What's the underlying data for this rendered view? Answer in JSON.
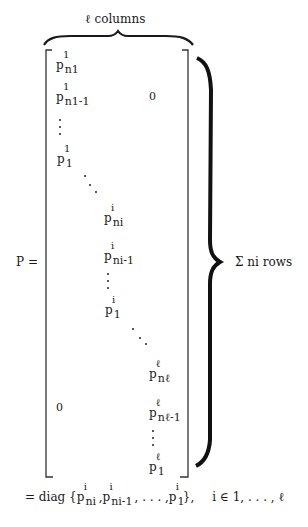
{
  "figure": {
    "top_label": "ℓ columns",
    "right_label": "Σ ni rows",
    "lhs": "P =",
    "zero_upper": "0",
    "zero_lower": "0",
    "block1": [
      {
        "base": "p",
        "sup": "1",
        "sub": "n1"
      },
      {
        "base": "p",
        "sup": "1",
        "sub": "n1-1"
      },
      {
        "base": "p",
        "sup": "1",
        "sub": "1"
      }
    ],
    "blocki": [
      {
        "base": "p",
        "sup": "i",
        "sub": "ni"
      },
      {
        "base": "p",
        "sup": "i",
        "sub": "ni-1"
      },
      {
        "base": "p",
        "sup": "i",
        "sub": "1"
      }
    ],
    "blockl": [
      {
        "base": "p",
        "sup": "ℓ",
        "sub": "nℓ"
      },
      {
        "base": "p",
        "sup": "ℓ",
        "sub": "nℓ-1"
      },
      {
        "base": "p",
        "sup": "ℓ",
        "sub": "1"
      }
    ],
    "equation": {
      "prefix": "= diag {",
      "terms": [
        {
          "base": "p",
          "sup": "i",
          "sub": "ni"
        },
        {
          "base": "p",
          "sup": "i",
          "sub": "ni-1"
        },
        {
          "base": "p",
          "sup": "i",
          "sub": "1"
        }
      ],
      "sep1": ",",
      "sep2": ", . . . ,",
      "suffix": "},",
      "condition": "i ∈ 1,  . . . ,  ℓ"
    }
  }
}
